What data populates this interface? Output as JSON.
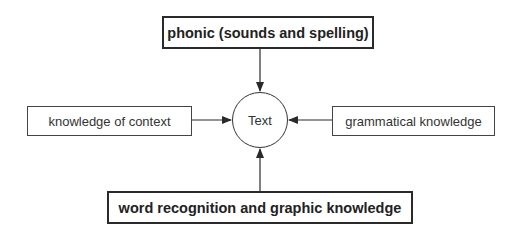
{
  "diagram": {
    "center": {
      "label": "Text"
    },
    "top": {
      "label": "phonic (sounds and spelling)",
      "emphasis": "bold"
    },
    "left": {
      "label": "knowledge of context",
      "emphasis": "normal"
    },
    "right": {
      "label": "grammatical knowledge",
      "emphasis": "normal"
    },
    "bottom": {
      "label": "word recognition and graphic knowledge",
      "emphasis": "bold"
    },
    "edges": [
      {
        "from": "top",
        "to": "center"
      },
      {
        "from": "left",
        "to": "center"
      },
      {
        "from": "right",
        "to": "center"
      },
      {
        "from": "bottom",
        "to": "center"
      }
    ],
    "colors": {
      "stroke": "#2a2a2a",
      "background": "#ffffff",
      "text": "#222222"
    }
  }
}
